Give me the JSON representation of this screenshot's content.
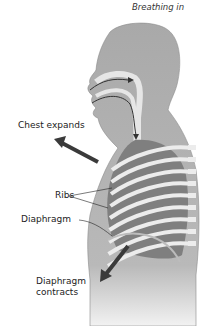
{
  "title": "Breathing in",
  "labels": {
    "chest_expands": "Chest expands",
    "ribs": "Ribs",
    "diaphragm": "Diaphragm",
    "diaphragm_contracts_line1": "Diaphragm",
    "diaphragm_contracts_line2": "contracts"
  },
  "colors": {
    "body": "#a9a9a9",
    "lung": "#7f7f7f",
    "rib": "#ececec",
    "arrow": "#3a3a3a",
    "outline": "#8c8c8c"
  }
}
